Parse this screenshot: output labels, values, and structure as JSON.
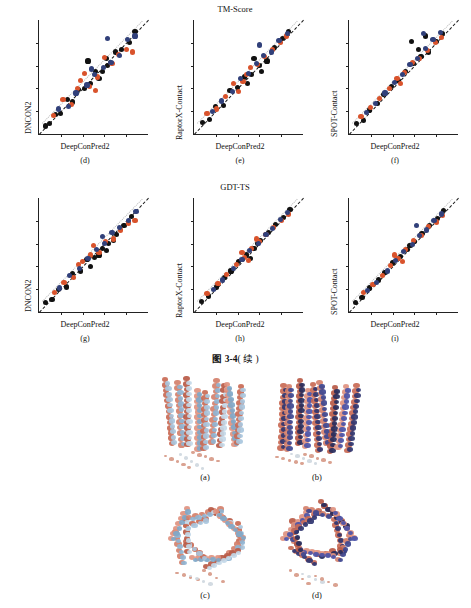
{
  "figure": {
    "caption_prefix": "图 3-4",
    "caption_suffix": "( 续 )",
    "top_titles": {
      "tm_score": "TM-Score",
      "gdt_ts": "GDT-TS"
    }
  },
  "chart_data": [
    {
      "type": "scatter",
      "panel": "(d)",
      "title": "",
      "xlabel": "DeepConPred2",
      "ylabel": "DNCON2",
      "xlim": [
        0,
        1
      ],
      "ylim": [
        0,
        1
      ],
      "grid": false,
      "series": [
        {
          "name": "black",
          "color": "#111111",
          "x": [
            0.06,
            0.1,
            0.15,
            0.2,
            0.26,
            0.31,
            0.36,
            0.42,
            0.47,
            0.52,
            0.58,
            0.63,
            0.7,
            0.76,
            0.83,
            0.88,
            0.45,
            0.55,
            0.62
          ],
          "y": [
            0.07,
            0.09,
            0.17,
            0.18,
            0.3,
            0.28,
            0.39,
            0.4,
            0.44,
            0.55,
            0.55,
            0.6,
            0.72,
            0.74,
            0.8,
            0.9,
            0.64,
            0.49,
            0.66
          ]
        },
        {
          "name": "red",
          "color": "#d9532c",
          "x": [
            0.13,
            0.22,
            0.3,
            0.38,
            0.46,
            0.54,
            0.6,
            0.67,
            0.73,
            0.8,
            0.86,
            0.52,
            0.42,
            0.35
          ],
          "y": [
            0.16,
            0.3,
            0.26,
            0.47,
            0.42,
            0.5,
            0.67,
            0.62,
            0.7,
            0.74,
            0.72,
            0.38,
            0.53,
            0.4
          ]
        },
        {
          "name": "blue",
          "color": "#31407a",
          "x": [
            0.18,
            0.27,
            0.34,
            0.44,
            0.51,
            0.59,
            0.66,
            0.74,
            0.81,
            0.88,
            0.63,
            0.48
          ],
          "y": [
            0.22,
            0.24,
            0.36,
            0.43,
            0.52,
            0.58,
            0.63,
            0.69,
            0.83,
            0.86,
            0.84,
            0.57
          ]
        }
      ],
      "reference_line": {
        "type": "diagonal",
        "style": "dashed",
        "color": "#1a1a1a"
      },
      "fit_line": {
        "style": "dotted",
        "color": "#bbbbbb"
      }
    },
    {
      "type": "scatter",
      "panel": "(e)",
      "title": "TM-Score",
      "xlabel": "DeepConPred2",
      "ylabel": "RaptorX-Contact",
      "xlim": [
        0,
        1
      ],
      "ylim": [
        0,
        1
      ],
      "grid": false,
      "series": [
        {
          "name": "black",
          "color": "#111111",
          "x": [
            0.08,
            0.14,
            0.2,
            0.27,
            0.33,
            0.4,
            0.46,
            0.53,
            0.6,
            0.67,
            0.74,
            0.81,
            0.87,
            0.55,
            0.62,
            0.49
          ],
          "y": [
            0.1,
            0.13,
            0.24,
            0.25,
            0.38,
            0.41,
            0.5,
            0.52,
            0.6,
            0.64,
            0.76,
            0.84,
            0.9,
            0.66,
            0.55,
            0.44
          ]
        },
        {
          "name": "red",
          "color": "#d9532c",
          "x": [
            0.12,
            0.21,
            0.29,
            0.36,
            0.45,
            0.52,
            0.58,
            0.65,
            0.72,
            0.79,
            0.85,
            0.41,
            0.48
          ],
          "y": [
            0.18,
            0.22,
            0.33,
            0.44,
            0.46,
            0.58,
            0.61,
            0.68,
            0.74,
            0.8,
            0.86,
            0.37,
            0.52
          ]
        },
        {
          "name": "blue",
          "color": "#31407a",
          "x": [
            0.17,
            0.25,
            0.35,
            0.43,
            0.5,
            0.57,
            0.64,
            0.71,
            0.78,
            0.86,
            0.6
          ],
          "y": [
            0.2,
            0.29,
            0.37,
            0.49,
            0.53,
            0.62,
            0.69,
            0.72,
            0.82,
            0.88,
            0.78
          ]
        }
      ],
      "reference_line": {
        "type": "diagonal",
        "style": "dashed",
        "color": "#1a1a1a"
      },
      "fit_line": {
        "style": "dotted",
        "color": "#bbbbbb"
      }
    },
    {
      "type": "scatter",
      "panel": "(f)",
      "title": "",
      "xlabel": "DeepConPred2",
      "ylabel": "SPOT-Contact",
      "xlim": [
        0,
        1
      ],
      "ylim": [
        0,
        1
      ],
      "grid": false,
      "series": [
        {
          "name": "black",
          "color": "#111111",
          "x": [
            0.07,
            0.13,
            0.19,
            0.26,
            0.32,
            0.39,
            0.45,
            0.52,
            0.59,
            0.66,
            0.73,
            0.8,
            0.86,
            0.57,
            0.64,
            0.7
          ],
          "y": [
            0.09,
            0.12,
            0.21,
            0.27,
            0.35,
            0.42,
            0.47,
            0.55,
            0.62,
            0.68,
            0.72,
            0.81,
            0.88,
            0.81,
            0.74,
            0.86
          ]
        },
        {
          "name": "red",
          "color": "#d9532c",
          "x": [
            0.11,
            0.2,
            0.28,
            0.37,
            0.44,
            0.51,
            0.58,
            0.65,
            0.72,
            0.79,
            0.85,
            0.47
          ],
          "y": [
            0.15,
            0.23,
            0.31,
            0.4,
            0.49,
            0.54,
            0.63,
            0.66,
            0.73,
            0.8,
            0.85,
            0.44
          ]
        },
        {
          "name": "blue",
          "color": "#31407a",
          "x": [
            0.16,
            0.24,
            0.33,
            0.42,
            0.49,
            0.56,
            0.63,
            0.7,
            0.77,
            0.84,
            0.68
          ],
          "y": [
            0.19,
            0.27,
            0.36,
            0.45,
            0.52,
            0.61,
            0.66,
            0.75,
            0.83,
            0.89,
            0.88
          ]
        }
      ],
      "reference_line": {
        "type": "diagonal",
        "style": "dashed",
        "color": "#1a1a1a"
      },
      "fit_line": {
        "style": "dotted",
        "color": "#bbbbbb"
      }
    },
    {
      "type": "scatter",
      "panel": "(g)",
      "title": "",
      "xlabel": "DeepConPred2",
      "ylabel": "DNCON2",
      "xlim": [
        0,
        1
      ],
      "ylim": [
        0,
        1
      ],
      "grid": false,
      "series": [
        {
          "name": "black",
          "color": "#111111",
          "x": [
            0.06,
            0.12,
            0.18,
            0.25,
            0.31,
            0.38,
            0.44,
            0.51,
            0.58,
            0.64,
            0.71,
            0.78,
            0.85,
            0.47,
            0.55,
            0.62,
            0.68
          ],
          "y": [
            0.08,
            0.11,
            0.2,
            0.22,
            0.34,
            0.36,
            0.46,
            0.48,
            0.56,
            0.6,
            0.68,
            0.76,
            0.84,
            0.4,
            0.5,
            0.54,
            0.63
          ]
        },
        {
          "name": "red",
          "color": "#d9532c",
          "x": [
            0.14,
            0.23,
            0.32,
            0.4,
            0.47,
            0.55,
            0.61,
            0.68,
            0.75,
            0.82,
            0.88,
            0.5,
            0.36
          ],
          "y": [
            0.17,
            0.26,
            0.3,
            0.44,
            0.5,
            0.52,
            0.62,
            0.64,
            0.72,
            0.78,
            0.8,
            0.58,
            0.42
          ]
        },
        {
          "name": "blue",
          "color": "#31407a",
          "x": [
            0.19,
            0.28,
            0.37,
            0.45,
            0.53,
            0.6,
            0.67,
            0.74,
            0.82,
            0.89,
            0.58
          ],
          "y": [
            0.21,
            0.32,
            0.38,
            0.47,
            0.55,
            0.6,
            0.7,
            0.74,
            0.8,
            0.88,
            0.66
          ]
        }
      ],
      "reference_line": {
        "type": "diagonal",
        "style": "dashed",
        "color": "#1a1a1a"
      },
      "fit_line": {
        "style": "dotted",
        "color": "#bbbbbb"
      }
    },
    {
      "type": "scatter",
      "panel": "(h)",
      "title": "GDT-TS",
      "xlabel": "DeepConPred2",
      "ylabel": "RaptorX-Contact",
      "xlim": [
        0,
        1
      ],
      "ylim": [
        0,
        1
      ],
      "grid": false,
      "series": [
        {
          "name": "black",
          "color": "#111111",
          "x": [
            0.07,
            0.13,
            0.21,
            0.28,
            0.34,
            0.41,
            0.48,
            0.55,
            0.61,
            0.68,
            0.75,
            0.82,
            0.88,
            0.52,
            0.58
          ],
          "y": [
            0.09,
            0.14,
            0.22,
            0.3,
            0.36,
            0.44,
            0.5,
            0.56,
            0.63,
            0.7,
            0.77,
            0.83,
            0.9,
            0.47,
            0.6
          ]
        },
        {
          "name": "red",
          "color": "#d9532c",
          "x": [
            0.12,
            0.22,
            0.3,
            0.39,
            0.46,
            0.53,
            0.6,
            0.66,
            0.73,
            0.8,
            0.87,
            0.44,
            0.5,
            0.57
          ],
          "y": [
            0.16,
            0.25,
            0.33,
            0.42,
            0.48,
            0.56,
            0.62,
            0.68,
            0.74,
            0.8,
            0.86,
            0.52,
            0.45,
            0.64
          ]
        },
        {
          "name": "blue",
          "color": "#31407a",
          "x": [
            0.18,
            0.26,
            0.36,
            0.44,
            0.51,
            0.59,
            0.66,
            0.72,
            0.79,
            0.86
          ],
          "y": [
            0.2,
            0.28,
            0.38,
            0.46,
            0.54,
            0.6,
            0.68,
            0.73,
            0.81,
            0.87
          ]
        }
      ],
      "reference_line": {
        "type": "diagonal",
        "style": "dashed",
        "color": "#1a1a1a"
      },
      "fit_line": {
        "style": "dotted",
        "color": "#bbbbbb"
      }
    },
    {
      "type": "scatter",
      "panel": "(i)",
      "title": "",
      "xlabel": "DeepConPred2",
      "ylabel": "SPOT-Contact",
      "xlim": [
        0,
        1
      ],
      "ylim": [
        0,
        1
      ],
      "grid": false,
      "series": [
        {
          "name": "black",
          "color": "#111111",
          "x": [
            0.06,
            0.12,
            0.19,
            0.27,
            0.33,
            0.4,
            0.47,
            0.54,
            0.6,
            0.67,
            0.74,
            0.81,
            0.87,
            0.56
          ],
          "y": [
            0.08,
            0.13,
            0.21,
            0.28,
            0.35,
            0.43,
            0.49,
            0.55,
            0.62,
            0.69,
            0.76,
            0.82,
            0.89,
            0.58
          ]
        },
        {
          "name": "red",
          "color": "#d9532c",
          "x": [
            0.13,
            0.22,
            0.31,
            0.38,
            0.45,
            0.52,
            0.59,
            0.66,
            0.73,
            0.8,
            0.86,
            0.42,
            0.49
          ],
          "y": [
            0.17,
            0.24,
            0.32,
            0.41,
            0.47,
            0.55,
            0.63,
            0.67,
            0.75,
            0.79,
            0.85,
            0.5,
            0.44
          ]
        },
        {
          "name": "blue",
          "color": "#31407a",
          "x": [
            0.17,
            0.25,
            0.35,
            0.43,
            0.5,
            0.58,
            0.65,
            0.71,
            0.78,
            0.85,
            0.62
          ],
          "y": [
            0.19,
            0.26,
            0.36,
            0.45,
            0.53,
            0.59,
            0.67,
            0.72,
            0.8,
            0.86,
            0.76
          ]
        }
      ],
      "reference_line": {
        "type": "diagonal",
        "style": "dashed",
        "color": "#1a1a1a"
      },
      "fit_line": {
        "style": "dotted",
        "color": "#bbbbbb"
      }
    }
  ],
  "protein_panels": [
    {
      "label": "(a)",
      "alt": "superposed protein structure cartoon, salmon and light blue helices, side view"
    },
    {
      "label": "(b)",
      "alt": "superposed protein structure cartoon, salmon and dark blue helices, side view"
    },
    {
      "label": "(c)",
      "alt": "superposed protein structure cartoon, salmon and light blue helices, top view"
    },
    {
      "label": "(d)",
      "alt": "superposed protein structure cartoon, salmon and dark blue helices, top view"
    }
  ]
}
